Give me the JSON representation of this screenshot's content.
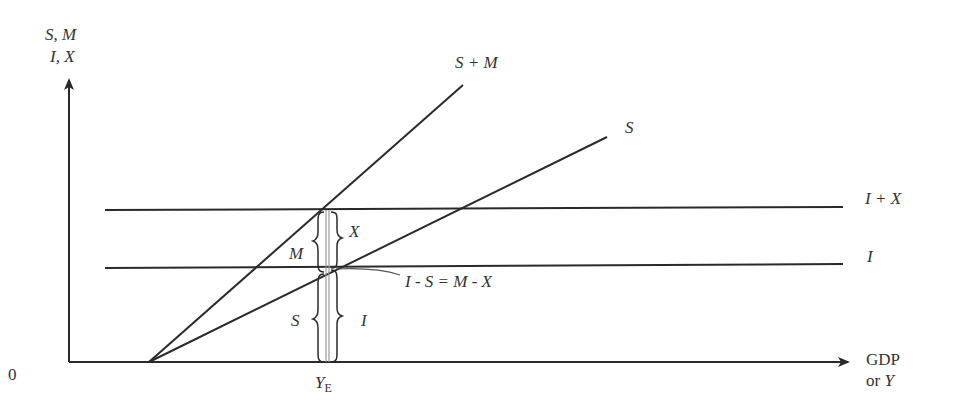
{
  "diagram": {
    "y_axis_label_line1": "S, M",
    "y_axis_label_line2": "I, X",
    "x_axis_label_line1": "GDP",
    "x_axis_label_line2_prefix": "or ",
    "x_axis_label_line2_var": "Y",
    "origin_label": "0",
    "equilibrium_label_base": "Y",
    "equilibrium_label_sub": "E",
    "curves": [
      {
        "id": "s_plus_m",
        "label": "S + M",
        "type": "upward-sloping"
      },
      {
        "id": "s",
        "label": "S",
        "type": "upward-sloping"
      },
      {
        "id": "i_plus_x",
        "label": "I + X",
        "type": "horizontal"
      },
      {
        "id": "i",
        "label": "I",
        "type": "horizontal"
      }
    ],
    "brace_labels": {
      "m": "M",
      "x": "X",
      "s": "S",
      "i": "I"
    },
    "annotation": "I - S = M - X",
    "colors": {
      "line": "#2a2a2a",
      "guide": "#999999",
      "text": "#333333"
    }
  }
}
